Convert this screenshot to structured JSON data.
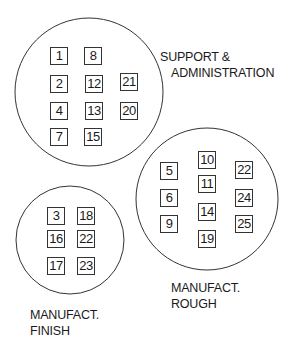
{
  "zones": [
    {
      "name": "support-administration",
      "circle": {
        "cx": 89,
        "cy": 92,
        "r": 74
      },
      "label_lines": [
        "SUPPORT &",
        "ADMINISTRATION"
      ],
      "label_pos": {
        "x": 160,
        "y": 50
      },
      "label_indent": 11,
      "departments": [
        {
          "id": "1",
          "x": 50,
          "y": 47
        },
        {
          "id": "8",
          "x": 84,
          "y": 47
        },
        {
          "id": "2",
          "x": 50,
          "y": 75
        },
        {
          "id": "12",
          "x": 85,
          "y": 75
        },
        {
          "id": "21",
          "x": 120,
          "y": 73
        },
        {
          "id": "4",
          "x": 50,
          "y": 102
        },
        {
          "id": "13",
          "x": 85,
          "y": 102
        },
        {
          "id": "20",
          "x": 120,
          "y": 102
        },
        {
          "id": "7",
          "x": 50,
          "y": 128
        },
        {
          "id": "15",
          "x": 84,
          "y": 128
        }
      ]
    },
    {
      "name": "manufact-rough",
      "circle": {
        "cx": 207,
        "cy": 199,
        "r": 71
      },
      "label_lines": [
        "MANUFACT.",
        "ROUGH"
      ],
      "label_pos": {
        "x": 171,
        "y": 281
      },
      "label_indent": 0,
      "departments": [
        {
          "id": "5",
          "x": 160,
          "y": 162
        },
        {
          "id": "10",
          "x": 198,
          "y": 151
        },
        {
          "id": "22",
          "x": 235,
          "y": 161
        },
        {
          "id": "11",
          "x": 198,
          "y": 175
        },
        {
          "id": "6",
          "x": 160,
          "y": 189
        },
        {
          "id": "24",
          "x": 235,
          "y": 189
        },
        {
          "id": "14",
          "x": 198,
          "y": 203
        },
        {
          "id": "9",
          "x": 160,
          "y": 215
        },
        {
          "id": "25",
          "x": 235,
          "y": 215
        },
        {
          "id": "19",
          "x": 198,
          "y": 230
        }
      ]
    },
    {
      "name": "manufact-finish",
      "circle": {
        "cx": 70,
        "cy": 240,
        "r": 54
      },
      "label_lines": [
        "MANUFACT.",
        "FINISH"
      ],
      "label_pos": {
        "x": 30,
        "y": 308
      },
      "label_indent": 0,
      "departments": [
        {
          "id": "3",
          "x": 47,
          "y": 207
        },
        {
          "id": "18",
          "x": 77,
          "y": 207
        },
        {
          "id": "16",
          "x": 47,
          "y": 230
        },
        {
          "id": "22",
          "x": 77,
          "y": 230
        },
        {
          "id": "17",
          "x": 47,
          "y": 257
        },
        {
          "id": "23",
          "x": 77,
          "y": 257
        }
      ]
    }
  ]
}
